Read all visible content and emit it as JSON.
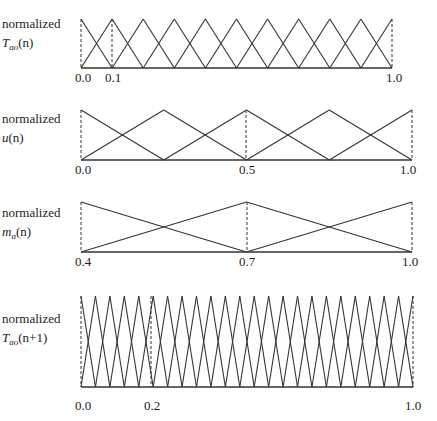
{
  "figure": {
    "panels": [
      {
        "id": "tao-n",
        "label_line1": "normalized",
        "label_var": "T",
        "label_sub": "ao",
        "label_args": "(n)",
        "ticks": [
          "0.0",
          "0.1",
          "1.0"
        ],
        "tick_positions": [
          0.0,
          0.1,
          1.0
        ],
        "peaks_count": 11,
        "dashed_at": [
          0.0,
          0.1,
          1.0
        ]
      },
      {
        "id": "u-n",
        "label_line1": "normalized",
        "label_var": "u",
        "label_sub": "",
        "label_args": "(n)",
        "ticks": [
          "0.0",
          "0.5",
          "1.0"
        ],
        "tick_positions": [
          0.0,
          0.5,
          1.0
        ],
        "peaks_count": 5,
        "dashed_at": [
          0.0,
          0.5,
          1.0
        ]
      },
      {
        "id": "ma-n",
        "label_line1": "normalized",
        "label_var": "m",
        "label_sub": "a",
        "label_args": "(n)",
        "ticks": [
          "0.4",
          "0.7",
          "1.0"
        ],
        "tick_positions": [
          0.4,
          0.7,
          1.0
        ],
        "peaks_count": 3,
        "dashed_at": [
          0.4,
          0.7,
          1.0
        ]
      },
      {
        "id": "tao-n1",
        "label_line1": "normalized",
        "label_var": "T",
        "label_sub": "ao",
        "label_args": "(n+1)",
        "ticks": [
          "0.0",
          "0.2",
          "1.0"
        ],
        "tick_positions": [
          0.0,
          0.2,
          1.0
        ],
        "peaks_count": 24,
        "dashed_at": [
          0.0,
          0.2,
          1.0
        ]
      }
    ]
  }
}
